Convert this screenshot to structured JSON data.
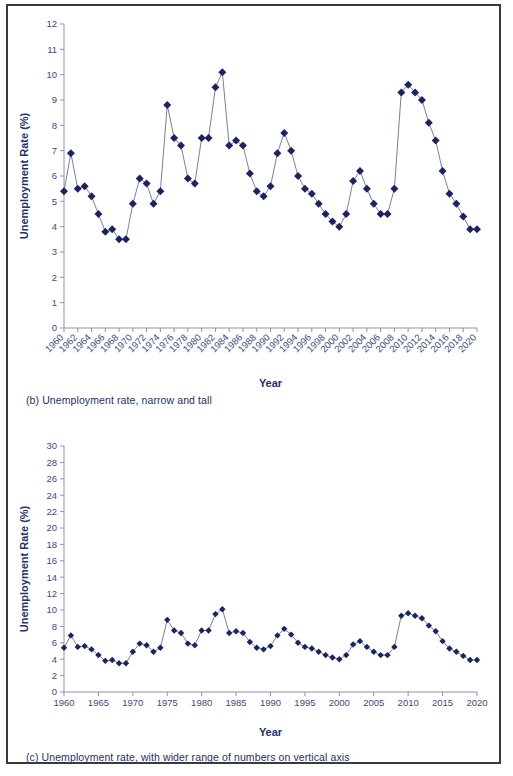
{
  "figure": {
    "panels": [
      {
        "id": "b",
        "caption": "(b) Unemployment rate, narrow and tall"
      },
      {
        "id": "c",
        "caption": "(c) Unemployment rate, with wider range of numbers on vertical axis"
      }
    ]
  },
  "chart_data": [
    {
      "type": "line",
      "panel": "b",
      "title": "",
      "xlabel": "Year",
      "ylabel": "Unemployment Rate (%)",
      "ylim": [
        0,
        12
      ],
      "ytick_step": 1,
      "yticks": [
        0,
        1,
        2,
        3,
        4,
        5,
        6,
        7,
        8,
        9,
        10,
        11,
        12
      ],
      "xlim": [
        1960,
        2020
      ],
      "xtick_step": 2,
      "xticks": [
        1960,
        1962,
        1964,
        1966,
        1968,
        1970,
        1972,
        1974,
        1976,
        1978,
        1980,
        1982,
        1984,
        1986,
        1988,
        1990,
        1992,
        1994,
        1996,
        1998,
        2000,
        2002,
        2004,
        2006,
        2008,
        2010,
        2012,
        2014,
        2016,
        2018,
        2020
      ],
      "xtick_label_rotation": -45,
      "grid": false,
      "legend": null,
      "marker": "diamond",
      "series": [
        {
          "name": "Unemployment Rate (%)",
          "color": "#1b2463",
          "x": [
            1960,
            1961,
            1962,
            1963,
            1964,
            1965,
            1966,
            1967,
            1968,
            1969,
            1970,
            1971,
            1972,
            1973,
            1974,
            1975,
            1976,
            1977,
            1978,
            1979,
            1980,
            1981,
            1982,
            1983,
            1984,
            1985,
            1986,
            1987,
            1988,
            1989,
            1990,
            1991,
            1992,
            1993,
            1994,
            1995,
            1996,
            1997,
            1998,
            1999,
            2000,
            2001,
            2002,
            2003,
            2004,
            2005,
            2006,
            2007,
            2008,
            2009,
            2010,
            2011,
            2012,
            2013,
            2014,
            2015,
            2016,
            2017,
            2018,
            2019,
            2020
          ],
          "values": [
            5.4,
            6.9,
            5.5,
            5.6,
            5.2,
            4.5,
            3.8,
            3.9,
            3.5,
            3.5,
            4.9,
            5.9,
            5.7,
            4.9,
            5.4,
            8.8,
            7.5,
            7.2,
            5.9,
            5.7,
            7.5,
            7.5,
            9.5,
            10.1,
            7.2,
            7.4,
            7.2,
            6.1,
            5.4,
            5.2,
            5.6,
            6.9,
            7.7,
            7.0,
            6.0,
            5.5,
            5.3,
            4.9,
            4.5,
            4.2,
            4.0,
            4.5,
            5.8,
            6.2,
            5.5,
            4.9,
            4.5,
            4.5,
            5.5,
            9.3,
            9.6,
            9.3,
            9.0,
            8.1,
            7.4,
            6.2,
            5.3,
            4.9,
            4.4,
            3.9,
            3.9
          ]
        }
      ]
    },
    {
      "type": "line",
      "panel": "c",
      "title": "",
      "xlabel": "Year",
      "ylabel": "Unemployment Rate (%)",
      "ylim": [
        0,
        30
      ],
      "ytick_step": 2,
      "yticks": [
        0,
        2,
        4,
        6,
        8,
        10,
        12,
        14,
        16,
        18,
        20,
        22,
        24,
        26,
        28,
        30
      ],
      "xlim": [
        1960,
        2020
      ],
      "xtick_step": 5,
      "xticks": [
        1960,
        1965,
        1970,
        1975,
        1980,
        1985,
        1990,
        1995,
        2000,
        2005,
        2010,
        2015,
        2020
      ],
      "xtick_label_rotation": 0,
      "grid": false,
      "legend": null,
      "marker": "diamond",
      "series": [
        {
          "name": "Unemployment Rate (%)",
          "color": "#1b2463",
          "x": [
            1960,
            1961,
            1962,
            1963,
            1964,
            1965,
            1966,
            1967,
            1968,
            1969,
            1970,
            1971,
            1972,
            1973,
            1974,
            1975,
            1976,
            1977,
            1978,
            1979,
            1980,
            1981,
            1982,
            1983,
            1984,
            1985,
            1986,
            1987,
            1988,
            1989,
            1990,
            1991,
            1992,
            1993,
            1994,
            1995,
            1996,
            1997,
            1998,
            1999,
            2000,
            2001,
            2002,
            2003,
            2004,
            2005,
            2006,
            2007,
            2008,
            2009,
            2010,
            2011,
            2012,
            2013,
            2014,
            2015,
            2016,
            2017,
            2018,
            2019,
            2020
          ],
          "values": [
            5.4,
            6.9,
            5.5,
            5.6,
            5.2,
            4.5,
            3.8,
            3.9,
            3.5,
            3.5,
            4.9,
            5.9,
            5.7,
            4.9,
            5.4,
            8.8,
            7.5,
            7.2,
            5.9,
            5.7,
            7.5,
            7.5,
            9.5,
            10.1,
            7.2,
            7.4,
            7.2,
            6.1,
            5.4,
            5.2,
            5.6,
            6.9,
            7.7,
            7.0,
            6.0,
            5.5,
            5.3,
            4.9,
            4.5,
            4.2,
            4.0,
            4.5,
            5.8,
            6.2,
            5.5,
            4.9,
            4.5,
            4.5,
            5.5,
            9.3,
            9.6,
            9.3,
            9.0,
            8.1,
            7.4,
            6.2,
            5.3,
            4.9,
            4.4,
            3.9,
            3.9
          ]
        }
      ]
    }
  ],
  "colors": {
    "marker": "#1b2463",
    "line": "#6b6f95",
    "axis": "#8d93ae",
    "text": "#22306b",
    "frame": "#3a3a3a"
  }
}
